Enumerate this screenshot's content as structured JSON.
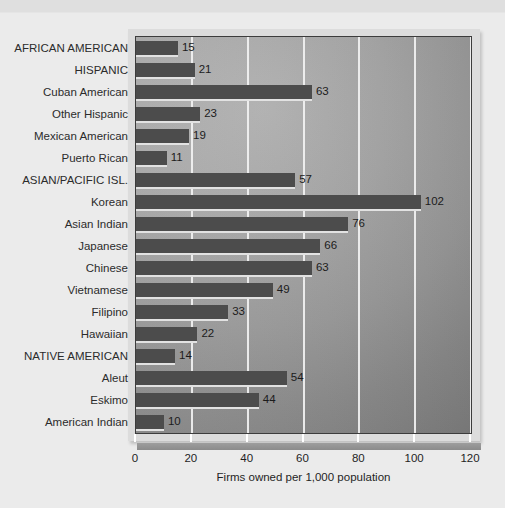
{
  "chart_data": {
    "type": "bar",
    "orientation": "horizontal",
    "title": "",
    "xlabel": "Firms owned per 1,000 population",
    "ylabel": "",
    "xlim": [
      0,
      120
    ],
    "xticks": [
      0,
      20,
      40,
      60,
      80,
      100,
      120
    ],
    "grid": true,
    "legend": false,
    "categories": [
      "AFRICAN AMERICAN",
      "HISPANIC",
      "Cuban American",
      "Other Hispanic",
      "Mexican American",
      "Puerto Rican",
      "ASIAN/PACIFIC ISL.",
      "Korean",
      "Asian Indian",
      "Japanese",
      "Chinese",
      "Vietnamese",
      "Filipino",
      "Hawaiian",
      "NATIVE AMERICAN",
      "Aleut",
      "Eskimo",
      "American Indian"
    ],
    "values": [
      15,
      21,
      63,
      23,
      19,
      11,
      57,
      102,
      76,
      66,
      63,
      49,
      33,
      22,
      14,
      54,
      44,
      10
    ],
    "value_labels": [
      "15",
      "21",
      "63",
      "23",
      "19",
      "11",
      "57",
      "102",
      "76",
      "66",
      "63",
      "49",
      "33",
      "22",
      "14",
      "54",
      "44",
      "10"
    ],
    "bar_color": "#4c4c4c",
    "gridline_color": "#f2f2f2",
    "plot_background": "#a0a0a0",
    "page_background": "#ebebeb"
  }
}
